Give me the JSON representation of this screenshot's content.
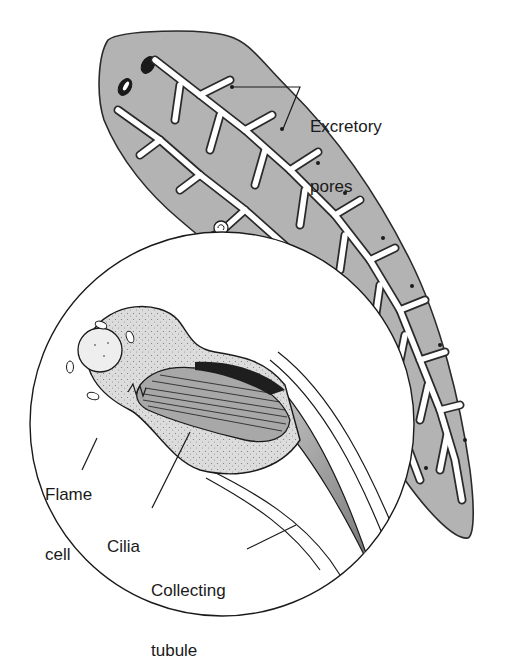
{
  "figure": {
    "colors": {
      "body_fill": "#b3b3b3",
      "outline": "#2a2a2a",
      "tubule_fill": "#ffffff",
      "cell_fill": "#d9d9d9",
      "cilia_fill": "#a8a8a8",
      "background": "#ffffff"
    }
  },
  "labels": {
    "excretory_pores": {
      "line1": "Excretory",
      "line2": "pores"
    },
    "flame_cell": {
      "line1": "Flame",
      "line2": "cell"
    },
    "cilia": {
      "line1": "Cilia"
    },
    "collecting_tubule": {
      "line1": "Collecting",
      "line2": "tubule"
    }
  }
}
